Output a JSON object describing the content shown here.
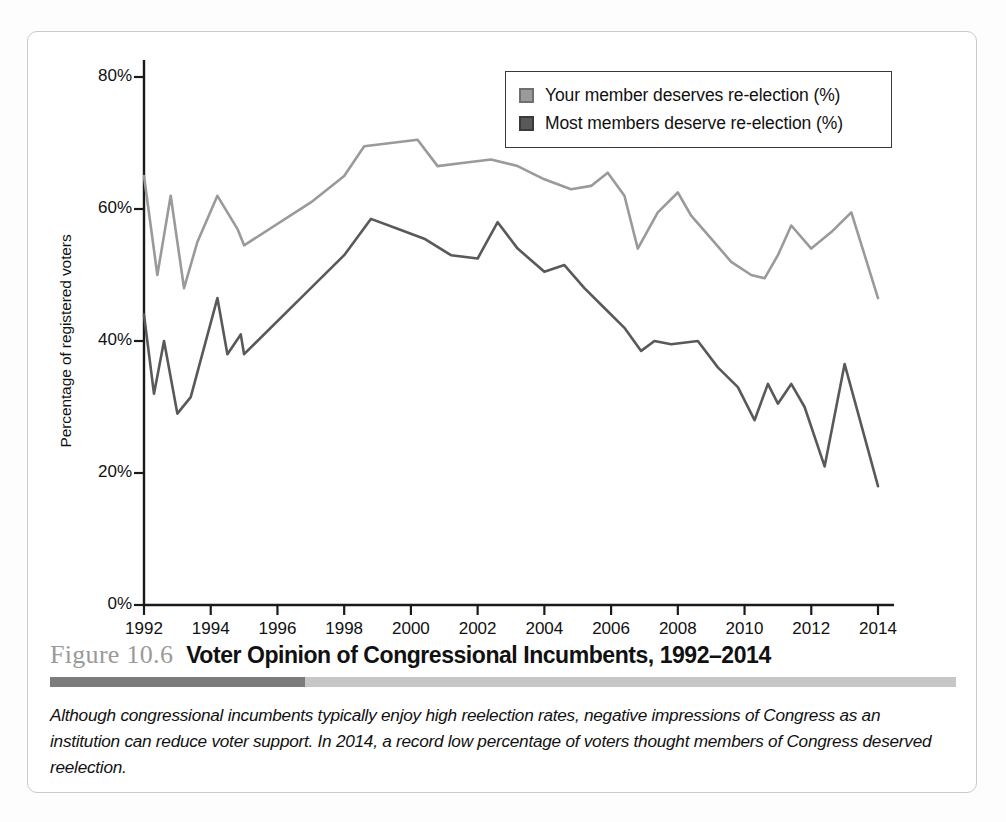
{
  "figure": {
    "number": "Figure 10.6",
    "title": "Voter Opinion of Congressional Incumbents, 1992–2014",
    "caption": "Although congressional incumbents typically enjoy high reelection rates, negative impressions of Congress as an institution can reduce voter support. In 2014, a record low percentage of voters thought members of Congress deserved reelection."
  },
  "colors": {
    "series_light": "#9a9a9a",
    "series_dark": "#595959",
    "axis": "#1a1a1a",
    "card_border": "#c9c9c9",
    "rule_dark": "#7c7c7c",
    "rule_light": "#c6c6c6"
  },
  "legend": {
    "position": "top-right",
    "entries": [
      {
        "label": "Your member deserves re-election (%)",
        "color": "#9a9a9a",
        "swatch": "legend-swatch-light"
      },
      {
        "label": "Most members deserve re-election (%)",
        "color": "#595959",
        "swatch": "legend-swatch-dark"
      }
    ]
  },
  "chart_data": {
    "type": "line",
    "title": "Voter Opinion of Congressional Incumbents, 1992–2014",
    "xlabel": "",
    "ylabel": "Percentage of registered voters",
    "xlim": [
      1992,
      2014
    ],
    "ylim": [
      0,
      80
    ],
    "grid": false,
    "ytick_labels": [
      "0%",
      "20%",
      "40%",
      "60%",
      "80%"
    ],
    "ytick_values": [
      0,
      20,
      40,
      60,
      80
    ],
    "xtick_labels": [
      "1992",
      "1994",
      "1996",
      "1998",
      "2000",
      "2002",
      "2004",
      "2006",
      "2008",
      "2010",
      "2012",
      "2014"
    ],
    "xtick_values": [
      1992,
      1994,
      1996,
      1998,
      2000,
      2002,
      2004,
      2006,
      2008,
      2010,
      2012,
      2014
    ],
    "series": [
      {
        "name": "Your member deserves re-election (%)",
        "color": "#9a9a9a",
        "x": [
          1992.0,
          1992.4,
          1992.8,
          1993.2,
          1993.6,
          1994.2,
          1994.8,
          1995.0,
          1997.0,
          1998.0,
          1998.6,
          1999.4,
          2000.2,
          2000.8,
          2001.6,
          2002.4,
          2003.2,
          2004.0,
          2004.8,
          2005.4,
          2005.9,
          2006.4,
          2006.8,
          2007.4,
          2008.0,
          2008.4,
          2009.0,
          2009.6,
          2010.2,
          2010.6,
          2011.0,
          2011.4,
          2012.0,
          2012.6,
          2013.2,
          2014.0
        ],
        "y": [
          65.0,
          50.0,
          62.0,
          48.0,
          55.0,
          62.0,
          57.0,
          54.5,
          61.0,
          65.0,
          69.5,
          70.0,
          70.5,
          66.5,
          67.0,
          67.5,
          66.5,
          64.5,
          63.0,
          63.5,
          65.5,
          62.0,
          54.0,
          59.5,
          62.5,
          59.0,
          55.5,
          52.0,
          50.0,
          49.5,
          53.0,
          57.5,
          54.0,
          56.5,
          59.5,
          46.5
        ]
      },
      {
        "name": "Most members deserve re-election (%)",
        "color": "#595959",
        "x": [
          1992.0,
          1992.3,
          1992.6,
          1993.0,
          1993.4,
          1994.2,
          1994.5,
          1994.9,
          1995.0,
          1997.0,
          1998.0,
          1998.8,
          1999.6,
          2000.4,
          2001.2,
          2002.0,
          2002.6,
          2003.2,
          2004.0,
          2004.6,
          2005.2,
          2005.8,
          2006.4,
          2006.9,
          2007.3,
          2007.8,
          2008.6,
          2009.2,
          2009.8,
          2010.3,
          2010.7,
          2011.0,
          2011.4,
          2011.8,
          2012.4,
          2013.0,
          2014.0
        ],
        "y": [
          44.0,
          32.0,
          40.0,
          29.0,
          31.5,
          46.5,
          38.0,
          41.0,
          38.0,
          48.0,
          53.0,
          58.5,
          57.0,
          55.5,
          53.0,
          52.5,
          58.0,
          54.0,
          50.5,
          51.5,
          48.0,
          45.0,
          42.0,
          38.5,
          40.0,
          39.5,
          40.0,
          36.0,
          33.0,
          28.0,
          33.5,
          30.5,
          33.5,
          30.0,
          21.0,
          36.5,
          18.0
        ]
      }
    ]
  }
}
